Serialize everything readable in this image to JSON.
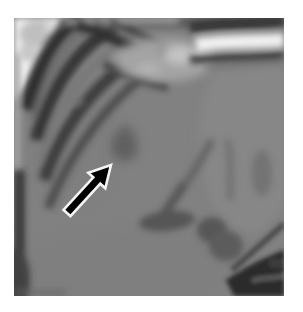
{
  "figure": {
    "kind": "grayscale-mri-scan",
    "colors": {
      "page_background": "#ffffff",
      "parenchyma": "#7a7a7a",
      "parenchyma_light": "#878787",
      "lesion": "#5a5a5a",
      "vessel_dark": "#484848",
      "chest_wall_dark": "#1e1e1e",
      "highlight_white": "#fafafa",
      "corner_black": "#121212"
    },
    "annotation": {
      "icon": "arrow-northeast-icon",
      "direction": "northeast",
      "fill": "#000000",
      "outline": "#f5f5f5"
    }
  }
}
